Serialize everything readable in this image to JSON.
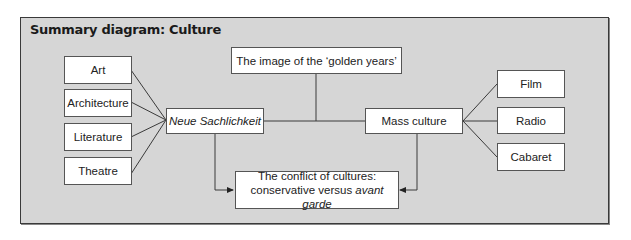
{
  "diagram": {
    "title": "Summary diagram: Culture",
    "nodes": {
      "art": "Art",
      "architecture": "Architecture",
      "literature": "Literature",
      "theatre": "Theatre",
      "neue": "Neue Sachlichkeit",
      "golden": "The image of the ‘golden years’",
      "mass": "Mass culture",
      "film": "Film",
      "radio": "Radio",
      "cabaret": "Cabaret",
      "conflict_line1": "The conflict of cultures:",
      "conflict_line2_prefix": "conservative versus ",
      "conflict_line2_italic": "avant garde"
    },
    "edges": [
      {
        "from": "Art",
        "to": "Neue Sachlichkeit"
      },
      {
        "from": "Architecture",
        "to": "Neue Sachlichkeit"
      },
      {
        "from": "Literature",
        "to": "Neue Sachlichkeit"
      },
      {
        "from": "Theatre",
        "to": "Neue Sachlichkeit"
      },
      {
        "from": "Neue Sachlichkeit",
        "to": "Mass culture"
      },
      {
        "from": "The image of the ‘golden years’",
        "to": "Neue Sachlichkeit–Mass culture link"
      },
      {
        "from": "Mass culture",
        "to": "Film"
      },
      {
        "from": "Mass culture",
        "to": "Radio"
      },
      {
        "from": "Mass culture",
        "to": "Cabaret"
      },
      {
        "from": "Neue Sachlichkeit",
        "to": "The conflict of cultures",
        "arrow": true
      },
      {
        "from": "Mass culture",
        "to": "The conflict of cultures",
        "arrow": true
      }
    ],
    "colors": {
      "panel_bg": "#d6d6d6",
      "border": "#3a3a3a",
      "box_bg": "#ffffff",
      "line": "#3a3a3a"
    }
  }
}
